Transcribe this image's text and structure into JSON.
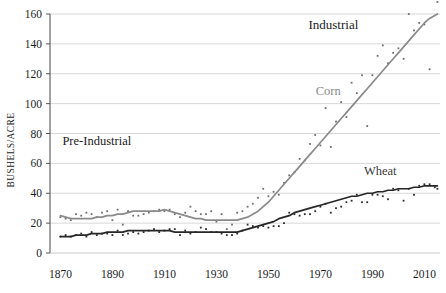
{
  "chart_data": {
    "type": "line",
    "title": "",
    "xlabel": "",
    "ylabel": "BUSHELS/ACRE",
    "xlim": [
      1866,
      2016
    ],
    "ylim": [
      0,
      160
    ],
    "grid": true,
    "legend": "none",
    "y_ticks": [
      0,
      20,
      40,
      60,
      80,
      100,
      120,
      140,
      160
    ],
    "x_ticks": [
      1870,
      1890,
      1910,
      1930,
      1950,
      1970,
      1990,
      2010
    ],
    "y_tick_labels": [
      "0",
      "20",
      "40",
      "60",
      "80",
      "100",
      "120",
      "140",
      "160"
    ],
    "x_tick_labels": [
      "1870",
      "1890",
      "1910",
      "1930",
      "1950",
      "1970",
      "1990",
      "2010"
    ],
    "annotations": [
      {
        "text": "Industrial",
        "x": 1975,
        "y": 150,
        "color": "#1a1a1a"
      },
      {
        "text": "Pre-Industrial",
        "x": 1884,
        "y": 72,
        "color": "#1a1a1a"
      },
      {
        "text": "Corn",
        "x": 1973,
        "y": 106,
        "color": "#8a8a8a"
      },
      {
        "text": "Wheat",
        "x": 1993,
        "y": 52,
        "color": "#3a3a3a"
      }
    ],
    "series": [
      {
        "name": "Corn",
        "color": "#8a8a8a",
        "marker_color": "#6e6e6e",
        "x": [
          1870,
          1872,
          1874,
          1876,
          1878,
          1880,
          1882,
          1884,
          1886,
          1888,
          1890,
          1892,
          1894,
          1896,
          1898,
          1900,
          1902,
          1904,
          1906,
          1908,
          1910,
          1912,
          1914,
          1916,
          1918,
          1920,
          1922,
          1924,
          1926,
          1928,
          1930,
          1932,
          1934,
          1936,
          1938,
          1940,
          1942,
          1944,
          1946,
          1948,
          1950,
          1952,
          1954,
          1956,
          1958,
          1960,
          1962,
          1964,
          1966,
          1968,
          1970,
          1972,
          1974,
          1976,
          1978,
          1980,
          1982,
          1984,
          1986,
          1988,
          1990,
          1992,
          1994,
          1996,
          1998,
          2000,
          2002,
          2004,
          2006,
          2008,
          2010,
          2012,
          2014,
          2015
        ],
        "values": [
          24,
          23,
          22,
          26,
          25,
          27,
          26,
          24,
          27,
          28,
          22,
          29,
          19,
          28,
          25,
          25,
          26,
          27,
          28,
          29,
          28,
          29,
          26,
          24,
          27,
          31,
          28,
          26,
          26,
          28,
          21,
          26,
          16,
          19,
          27,
          28,
          31,
          33,
          37,
          43,
          38,
          41,
          39,
          47,
          52,
          54,
          63,
          62,
          73,
          79,
          72,
          97,
          71,
          88,
          101,
          91,
          114,
          107,
          119,
          85,
          119,
          132,
          139,
          127,
          134,
          137,
          130,
          160,
          149,
          154,
          153,
          123,
          171,
          168
        ],
        "trend": [
          25,
          24,
          23,
          23,
          23,
          23,
          23,
          24,
          24,
          25,
          25,
          26,
          26,
          27,
          28,
          28,
          28,
          28,
          28,
          28,
          29,
          28,
          27,
          26,
          25,
          24,
          23,
          23,
          22,
          22,
          22,
          22,
          22,
          22,
          22,
          23,
          24,
          26,
          28,
          31,
          34,
          38,
          42,
          46,
          50,
          54,
          58,
          62,
          66,
          70,
          74,
          78,
          82,
          86,
          90,
          94,
          98,
          102,
          106,
          110,
          114,
          118,
          122,
          126,
          130,
          134,
          138,
          142,
          146,
          150,
          154,
          157,
          159,
          160
        ]
      },
      {
        "name": "Wheat",
        "color": "#262626",
        "marker_color": "#2b2b2b",
        "x": [
          1870,
          1872,
          1874,
          1876,
          1878,
          1880,
          1882,
          1884,
          1886,
          1888,
          1890,
          1892,
          1894,
          1896,
          1898,
          1900,
          1902,
          1904,
          1906,
          1908,
          1910,
          1912,
          1914,
          1916,
          1918,
          1920,
          1922,
          1924,
          1926,
          1928,
          1930,
          1932,
          1934,
          1936,
          1938,
          1940,
          1942,
          1944,
          1946,
          1948,
          1950,
          1952,
          1954,
          1956,
          1958,
          1960,
          1962,
          1964,
          1966,
          1968,
          1970,
          1972,
          1974,
          1976,
          1978,
          1980,
          1982,
          1984,
          1986,
          1988,
          1990,
          1992,
          1994,
          1996,
          1998,
          2000,
          2002,
          2004,
          2006,
          2008,
          2010,
          2012,
          2014,
          2015
        ],
        "values": [
          11,
          12,
          11,
          12,
          13,
          11,
          14,
          12,
          13,
          13,
          12,
          15,
          12,
          13,
          14,
          13,
          14,
          15,
          16,
          14,
          15,
          16,
          16,
          12,
          15,
          13,
          14,
          17,
          16,
          14,
          14,
          13,
          12,
          12,
          13,
          15,
          19,
          18,
          17,
          18,
          17,
          18,
          18,
          20,
          27,
          26,
          25,
          26,
          26,
          28,
          31,
          33,
          27,
          30,
          31,
          34,
          35,
          39,
          34,
          34,
          39,
          39,
          38,
          36,
          43,
          42,
          35,
          43,
          39,
          45,
          46,
          46,
          44,
          43
        ],
        "trend": [
          11,
          11,
          11,
          12,
          12,
          12,
          13,
          13,
          13,
          14,
          14,
          14,
          14,
          15,
          15,
          15,
          15,
          15,
          15,
          15,
          15,
          15,
          14,
          14,
          14,
          14,
          14,
          14,
          14,
          14,
          14,
          14,
          14,
          14,
          14,
          15,
          16,
          17,
          18,
          19,
          20,
          21,
          23,
          24,
          25,
          27,
          28,
          29,
          30,
          31,
          32,
          33,
          34,
          35,
          36,
          37,
          38,
          38,
          39,
          40,
          40,
          41,
          41,
          42,
          42,
          43,
          43,
          43,
          44,
          44,
          45,
          45,
          45,
          45
        ]
      }
    ]
  }
}
